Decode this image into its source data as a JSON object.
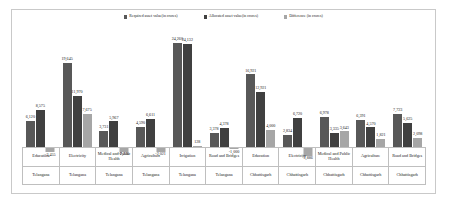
{
  "chart_data": {
    "type": "bar",
    "title": "",
    "xlabel": "",
    "ylabel": "",
    "grid": false,
    "legend_position": "top-center",
    "ylim": [
      -4000,
      26000
    ],
    "categories": [
      "Education",
      "Electricity",
      "Medical and Public Health",
      "Agriculture",
      "Irrigation",
      "Road and Bridges",
      "Education",
      "Electricity",
      "Medical and Public Health",
      "Agriculture",
      "Road and Bridges"
    ],
    "groups": [
      "Telangana",
      "Telangana",
      "Telangana",
      "Telangana",
      "Telangana",
      "Telangana",
      "Chhattisgarh",
      "Chhattisgarh",
      "Chhattisgarh",
      "Chhattisgarh",
      "Chhattisgarh"
    ],
    "series": [
      {
        "name": "Required asset value(in crores)",
        "color": "#585858",
        "values": [
          6120,
          19645,
          3731,
          4590,
          24260,
          3378,
          16921,
          2834,
          6978,
          6391,
          7723
        ],
        "labels": [
          "6,120",
          "19,645",
          "3,731",
          "4,590",
          "24,260",
          "3,378",
          "16,921",
          "2,834",
          "6,978",
          "6,391",
          "7,723"
        ]
      },
      {
        "name": "Allocated asset value(in crores)",
        "color": "#404040",
        "values": [
          8575,
          11970,
          5967,
          6611,
          24132,
          4378,
          12921,
          6720,
          3335,
          4570,
          5625
        ],
        "labels": [
          "8,575",
          "11,970",
          "5,967",
          "6,611",
          "24,132",
          "4,378",
          "12,921",
          "6,720",
          "3,335",
          "4,570",
          "5,625"
        ]
      },
      {
        "name": "Difference (in crores)",
        "color": "#a6a6a6",
        "values": [
          -2455,
          7675,
          -2236,
          -2021,
          128,
          -1000,
          4000,
          -3886,
          3643,
          1821,
          2098
        ],
        "labels": [
          "-2,455",
          "7,675",
          "-2,236",
          "-2,021",
          "128",
          "-1,000",
          "4,000",
          "-3,886",
          "3,643",
          "1,821",
          "2,098"
        ]
      }
    ]
  },
  "legend": {
    "items": [
      {
        "label": "Required asset value(in crores)",
        "color": "#585858"
      },
      {
        "label": "Allocated asset value(in crores)",
        "color": "#404040"
      },
      {
        "label": "Difference (in crores)",
        "color": "#a6a6a6"
      }
    ]
  }
}
